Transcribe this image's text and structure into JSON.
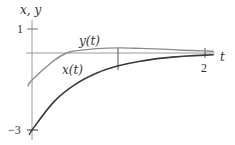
{
  "chart_data": {
    "type": "line",
    "title": "",
    "xlabel": "t",
    "ylabel": "x, y",
    "xlim": [
      0,
      2.1
    ],
    "ylim": [
      -3,
      1
    ],
    "x_ticks": [
      "1",
      "2"
    ],
    "y_ticks": [
      "1",
      "-3"
    ],
    "grid": false,
    "legend": "inline labels",
    "series": [
      {
        "name": "x(t)",
        "color": "#3a3a3a",
        "x": [
          0,
          0.25,
          0.5,
          0.75,
          1.0,
          1.25,
          1.5,
          1.75,
          2.0,
          2.1
        ],
        "values": [
          -3.0,
          -1.91,
          -1.22,
          -0.78,
          -0.5,
          -0.32,
          -0.2,
          -0.13,
          -0.08,
          -0.07
        ]
      },
      {
        "name": "y(t)",
        "color": "#8c8c8c",
        "x": [
          -0.05,
          0,
          0.25,
          0.4,
          0.5,
          0.75,
          1.0,
          1.25,
          1.5,
          1.75,
          2.0,
          2.1
        ],
        "values": [
          -1.3,
          -1.05,
          -0.3,
          0.0,
          0.08,
          0.17,
          0.2,
          0.18,
          0.15,
          0.11,
          0.08,
          0.07
        ]
      }
    ]
  },
  "labels": {
    "y_axis": "x, y",
    "x_axis": "t",
    "y_series_label": "y(t)",
    "x_series_label": "x(t)",
    "tick_1_y": "1",
    "tick_neg3_y": "−3",
    "tick_1_t": "1",
    "tick_2_t": "2"
  }
}
